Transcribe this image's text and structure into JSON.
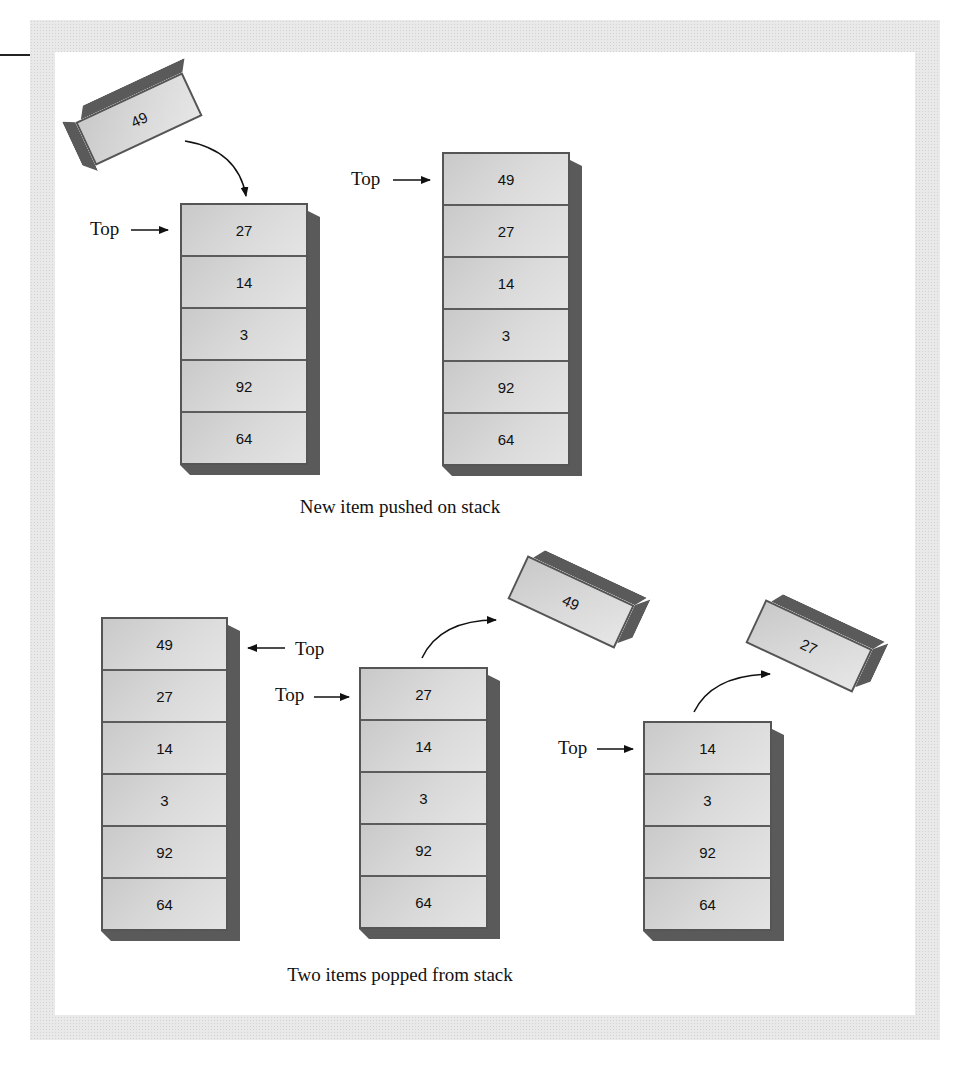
{
  "diagram": {
    "top_label": "Top",
    "push_section": {
      "caption": "New item pushed on stack",
      "incoming_item": "49",
      "before_stack": [
        "27",
        "14",
        "3",
        "92",
        "64"
      ],
      "after_stack": [
        "49",
        "27",
        "14",
        "3",
        "92",
        "64"
      ]
    },
    "pop_section": {
      "caption": "Two items popped from stack",
      "initial_stack": [
        "49",
        "27",
        "14",
        "3",
        "92",
        "64"
      ],
      "after_first_pop": [
        "27",
        "14",
        "3",
        "92",
        "64"
      ],
      "first_popped": "49",
      "after_second_pop": [
        "14",
        "3",
        "92",
        "64"
      ],
      "second_popped": "27"
    }
  },
  "colors": {
    "cell_fill": "#d4d4d4",
    "shadow": "#5a5a5a",
    "frame": "#e9e9e9",
    "text": "#111111"
  }
}
